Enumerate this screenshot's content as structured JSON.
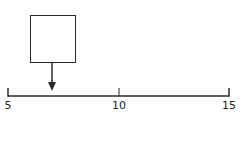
{
  "diagram": {
    "type": "number-line",
    "min": 5,
    "max": 15,
    "ticks": [
      {
        "value": 5,
        "label": "5"
      },
      {
        "value": 10,
        "label": "10"
      },
      {
        "value": 15,
        "label": "15"
      }
    ],
    "pointer": {
      "value": 7,
      "box_content": ""
    },
    "colors": {
      "line": "#2a2a2a",
      "background": "#ffffff"
    }
  }
}
